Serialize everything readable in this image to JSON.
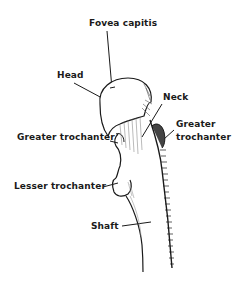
{
  "diagram": {
    "labels": {
      "fovea_capitis": "Fovea capitis",
      "head": "Head",
      "neck": "Neck",
      "greater_trochanter_right_line1": "Greater",
      "greater_trochanter_right_line2": "trochanter",
      "greater_trochanter_left": "Greater trochanter",
      "lesser_trochanter": "Lesser trochanter",
      "shaft": "Shaft"
    },
    "colors": {
      "ink": "#1a1a1a",
      "shading": "#555555",
      "background": "#ffffff"
    }
  }
}
